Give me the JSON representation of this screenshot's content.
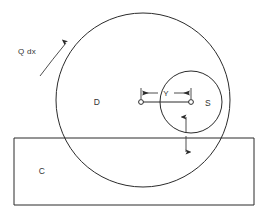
{
  "diagram": {
    "background_color": "#ffffff",
    "line_color": "#2b2b2b",
    "text_color": "#333333",
    "labels": {
      "heat_flux": "Q dx",
      "large_circle": "D",
      "small_circle": "S",
      "rectangle": "C",
      "dimension": "Y"
    },
    "geometry": {
      "large_circle": {
        "cx": 143,
        "cy": 100,
        "r": 87
      },
      "small_circle": {
        "cx": 191,
        "cy": 102,
        "r": 31
      },
      "rectangle": {
        "x": 14,
        "y": 138,
        "width": 240,
        "height": 67
      },
      "dimension_line": {
        "x1": 141,
        "x2": 191,
        "y": 93
      },
      "center_marker_left": {
        "cx": 141,
        "cy": 102,
        "r": 2.4
      },
      "center_marker_right": {
        "cx": 191,
        "cy": 102,
        "r": 2.4
      },
      "vertical_arrow": {
        "x": 186,
        "y_top": 117,
        "y_bottom": 152
      },
      "flux_arrow": {
        "x1": 44,
        "y1": 70,
        "x2": 68,
        "y2": 41
      }
    }
  }
}
